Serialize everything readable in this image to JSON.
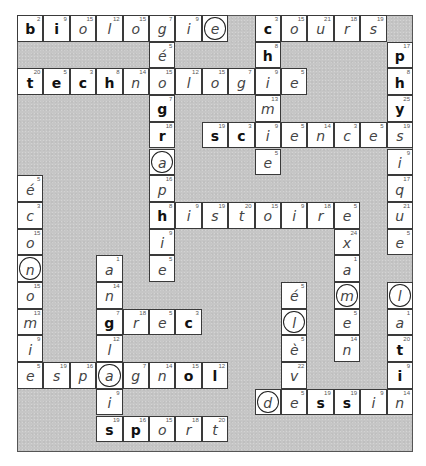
{
  "puzzle": {
    "type": "crossword",
    "cols": 15,
    "rows": 16,
    "colors": {
      "block": "#c6c6c6",
      "cell": "#ffffff",
      "border": "#3a3a3a",
      "text": "#222222"
    },
    "words": [
      "biologie",
      "cours",
      "technologie",
      "chimie",
      "géographie",
      "physique",
      "sciences",
      "histoire",
      "économie",
      "examen",
      "anglais",
      "grec",
      "élève",
      "latin",
      "espagnol",
      "dessin",
      "sport"
    ],
    "cells": [
      {
        "r": 0,
        "c": 0,
        "ch": "b",
        "n": "2",
        "style": "bold"
      },
      {
        "r": 0,
        "c": 1,
        "ch": "i",
        "n": "9",
        "style": "bold"
      },
      {
        "r": 0,
        "c": 2,
        "ch": "o",
        "n": "15",
        "style": "italic"
      },
      {
        "r": 0,
        "c": 3,
        "ch": "l",
        "n": "12",
        "style": "italic"
      },
      {
        "r": 0,
        "c": 4,
        "ch": "o",
        "n": "15",
        "style": "italic"
      },
      {
        "r": 0,
        "c": 5,
        "ch": "g",
        "n": "7",
        "style": "italic"
      },
      {
        "r": 0,
        "c": 6,
        "ch": "i",
        "n": "9",
        "style": "italic"
      },
      {
        "r": 0,
        "c": 7,
        "ch": "e",
        "n": "",
        "style": "italic",
        "circled": true
      },
      {
        "r": 0,
        "c": 9,
        "ch": "c",
        "n": "3",
        "style": "bold"
      },
      {
        "r": 0,
        "c": 10,
        "ch": "o",
        "n": "15",
        "style": "italic"
      },
      {
        "r": 0,
        "c": 11,
        "ch": "u",
        "n": "21",
        "style": "italic"
      },
      {
        "r": 0,
        "c": 12,
        "ch": "r",
        "n": "18",
        "style": "italic"
      },
      {
        "r": 0,
        "c": 13,
        "ch": "s",
        "n": "19",
        "style": "italic"
      },
      {
        "r": 1,
        "c": 5,
        "ch": "é",
        "n": "5",
        "style": "italic"
      },
      {
        "r": 1,
        "c": 9,
        "ch": "h",
        "n": "8",
        "style": "bold"
      },
      {
        "r": 1,
        "c": 14,
        "ch": "p",
        "n": "17",
        "style": "bold"
      },
      {
        "r": 2,
        "c": 0,
        "ch": "t",
        "n": "20",
        "style": "bold"
      },
      {
        "r": 2,
        "c": 1,
        "ch": "e",
        "n": "5",
        "style": "bold"
      },
      {
        "r": 2,
        "c": 2,
        "ch": "c",
        "n": "3",
        "style": "bold"
      },
      {
        "r": 2,
        "c": 3,
        "ch": "h",
        "n": "8",
        "style": "bold"
      },
      {
        "r": 2,
        "c": 4,
        "ch": "n",
        "n": "14",
        "style": "italic"
      },
      {
        "r": 2,
        "c": 5,
        "ch": "o",
        "n": "15",
        "style": "italic"
      },
      {
        "r": 2,
        "c": 6,
        "ch": "l",
        "n": "12",
        "style": "italic"
      },
      {
        "r": 2,
        "c": 7,
        "ch": "o",
        "n": "15",
        "style": "italic"
      },
      {
        "r": 2,
        "c": 8,
        "ch": "g",
        "n": "7",
        "style": "italic"
      },
      {
        "r": 2,
        "c": 9,
        "ch": "i",
        "n": "9",
        "style": "italic"
      },
      {
        "r": 2,
        "c": 10,
        "ch": "e",
        "n": "5",
        "style": "italic"
      },
      {
        "r": 2,
        "c": 14,
        "ch": "h",
        "n": "8",
        "style": "bold"
      },
      {
        "r": 3,
        "c": 5,
        "ch": "g",
        "n": "7",
        "style": "bold"
      },
      {
        "r": 3,
        "c": 9,
        "ch": "m",
        "n": "13",
        "style": "italic"
      },
      {
        "r": 3,
        "c": 14,
        "ch": "y",
        "n": "25",
        "style": "bold"
      },
      {
        "r": 4,
        "c": 5,
        "ch": "r",
        "n": "18",
        "style": "bold"
      },
      {
        "r": 4,
        "c": 7,
        "ch": "s",
        "n": "19",
        "style": "bold"
      },
      {
        "r": 4,
        "c": 8,
        "ch": "c",
        "n": "3",
        "style": "bold"
      },
      {
        "r": 4,
        "c": 9,
        "ch": "i",
        "n": "9",
        "style": "italic"
      },
      {
        "r": 4,
        "c": 10,
        "ch": "e",
        "n": "5",
        "style": "italic"
      },
      {
        "r": 4,
        "c": 11,
        "ch": "n",
        "n": "14",
        "style": "italic"
      },
      {
        "r": 4,
        "c": 12,
        "ch": "c",
        "n": "3",
        "style": "italic"
      },
      {
        "r": 4,
        "c": 13,
        "ch": "e",
        "n": "5",
        "style": "italic"
      },
      {
        "r": 4,
        "c": 14,
        "ch": "s",
        "n": "19",
        "style": "italic"
      },
      {
        "r": 5,
        "c": 5,
        "ch": "a",
        "n": "",
        "style": "italic",
        "circled": true
      },
      {
        "r": 5,
        "c": 9,
        "ch": "e",
        "n": "5",
        "style": "italic"
      },
      {
        "r": 5,
        "c": 14,
        "ch": "i",
        "n": "9",
        "style": "italic"
      },
      {
        "r": 6,
        "c": 0,
        "ch": "é",
        "n": "5",
        "style": "italic"
      },
      {
        "r": 6,
        "c": 5,
        "ch": "p",
        "n": "16",
        "style": "italic"
      },
      {
        "r": 6,
        "c": 14,
        "ch": "q",
        "n": "17",
        "style": "italic"
      },
      {
        "r": 7,
        "c": 0,
        "ch": "c",
        "n": "3",
        "style": "italic"
      },
      {
        "r": 7,
        "c": 5,
        "ch": "h",
        "n": "8",
        "style": "bold"
      },
      {
        "r": 7,
        "c": 6,
        "ch": "i",
        "n": "9",
        "style": "italic"
      },
      {
        "r": 7,
        "c": 7,
        "ch": "s",
        "n": "19",
        "style": "italic"
      },
      {
        "r": 7,
        "c": 8,
        "ch": "t",
        "n": "20",
        "style": "italic"
      },
      {
        "r": 7,
        "c": 9,
        "ch": "o",
        "n": "15",
        "style": "italic"
      },
      {
        "r": 7,
        "c": 10,
        "ch": "i",
        "n": "9",
        "style": "italic"
      },
      {
        "r": 7,
        "c": 11,
        "ch": "r",
        "n": "18",
        "style": "italic"
      },
      {
        "r": 7,
        "c": 12,
        "ch": "e",
        "n": "5",
        "style": "italic"
      },
      {
        "r": 7,
        "c": 14,
        "ch": "u",
        "n": "21",
        "style": "italic"
      },
      {
        "r": 8,
        "c": 0,
        "ch": "o",
        "n": "15",
        "style": "italic"
      },
      {
        "r": 8,
        "c": 5,
        "ch": "i",
        "n": "9",
        "style": "italic"
      },
      {
        "r": 8,
        "c": 12,
        "ch": "x",
        "n": "24",
        "style": "italic"
      },
      {
        "r": 8,
        "c": 14,
        "ch": "e",
        "n": "5",
        "style": "italic"
      },
      {
        "r": 9,
        "c": 0,
        "ch": "n",
        "n": "",
        "style": "italic",
        "circled": true
      },
      {
        "r": 9,
        "c": 3,
        "ch": "a",
        "n": "1",
        "style": "italic"
      },
      {
        "r": 9,
        "c": 5,
        "ch": "e",
        "n": "5",
        "style": "italic"
      },
      {
        "r": 9,
        "c": 12,
        "ch": "a",
        "n": "1",
        "style": "italic"
      },
      {
        "r": 10,
        "c": 0,
        "ch": "o",
        "n": "15",
        "style": "italic"
      },
      {
        "r": 10,
        "c": 3,
        "ch": "n",
        "n": "14",
        "style": "italic"
      },
      {
        "r": 10,
        "c": 10,
        "ch": "é",
        "n": "5",
        "style": "italic"
      },
      {
        "r": 10,
        "c": 12,
        "ch": "m",
        "n": "",
        "style": "italic",
        "circled": true
      },
      {
        "r": 10,
        "c": 14,
        "ch": "l",
        "n": "",
        "style": "italic",
        "circled": true
      },
      {
        "r": 11,
        "c": 0,
        "ch": "m",
        "n": "13",
        "style": "italic"
      },
      {
        "r": 11,
        "c": 3,
        "ch": "g",
        "n": "7",
        "style": "bold"
      },
      {
        "r": 11,
        "c": 4,
        "ch": "r",
        "n": "18",
        "style": "italic"
      },
      {
        "r": 11,
        "c": 5,
        "ch": "e",
        "n": "5",
        "style": "italic"
      },
      {
        "r": 11,
        "c": 6,
        "ch": "c",
        "n": "3",
        "style": "bold"
      },
      {
        "r": 11,
        "c": 10,
        "ch": "l",
        "n": "",
        "style": "italic",
        "circled": true
      },
      {
        "r": 11,
        "c": 12,
        "ch": "e",
        "n": "5",
        "style": "italic"
      },
      {
        "r": 11,
        "c": 14,
        "ch": "a",
        "n": "1",
        "style": "italic"
      },
      {
        "r": 12,
        "c": 0,
        "ch": "i",
        "n": "9",
        "style": "italic"
      },
      {
        "r": 12,
        "c": 3,
        "ch": "l",
        "n": "12",
        "style": "italic"
      },
      {
        "r": 12,
        "c": 10,
        "ch": "è",
        "n": "5",
        "style": "italic"
      },
      {
        "r": 12,
        "c": 12,
        "ch": "n",
        "n": "14",
        "style": "italic"
      },
      {
        "r": 12,
        "c": 14,
        "ch": "t",
        "n": "20",
        "style": "bold"
      },
      {
        "r": 13,
        "c": 0,
        "ch": "e",
        "n": "5",
        "style": "italic"
      },
      {
        "r": 13,
        "c": 1,
        "ch": "s",
        "n": "19",
        "style": "italic"
      },
      {
        "r": 13,
        "c": 2,
        "ch": "p",
        "n": "16",
        "style": "italic"
      },
      {
        "r": 13,
        "c": 3,
        "ch": "a",
        "n": "",
        "style": "italic",
        "circled": true
      },
      {
        "r": 13,
        "c": 4,
        "ch": "g",
        "n": "7",
        "style": "italic"
      },
      {
        "r": 13,
        "c": 5,
        "ch": "n",
        "n": "14",
        "style": "italic"
      },
      {
        "r": 13,
        "c": 6,
        "ch": "o",
        "n": "15",
        "style": "bold"
      },
      {
        "r": 13,
        "c": 7,
        "ch": "l",
        "n": "12",
        "style": "bold"
      },
      {
        "r": 13,
        "c": 10,
        "ch": "v",
        "n": "22",
        "style": "italic"
      },
      {
        "r": 13,
        "c": 14,
        "ch": "i",
        "n": "9",
        "style": "bold"
      },
      {
        "r": 14,
        "c": 3,
        "ch": "i",
        "n": "9",
        "style": "italic"
      },
      {
        "r": 14,
        "c": 9,
        "ch": "d",
        "n": "",
        "style": "italic",
        "circled": true
      },
      {
        "r": 14,
        "c": 10,
        "ch": "e",
        "n": "5",
        "style": "italic"
      },
      {
        "r": 14,
        "c": 11,
        "ch": "s",
        "n": "19",
        "style": "bold"
      },
      {
        "r": 14,
        "c": 12,
        "ch": "s",
        "n": "19",
        "style": "bold"
      },
      {
        "r": 14,
        "c": 13,
        "ch": "i",
        "n": "9",
        "style": "italic"
      },
      {
        "r": 14,
        "c": 14,
        "ch": "n",
        "n": "14",
        "style": "italic"
      },
      {
        "r": 15,
        "c": 3,
        "ch": "s",
        "n": "19",
        "style": "bold"
      },
      {
        "r": 15,
        "c": 4,
        "ch": "p",
        "n": "16",
        "style": "bold"
      },
      {
        "r": 15,
        "c": 5,
        "ch": "o",
        "n": "15",
        "style": "italic"
      },
      {
        "r": 15,
        "c": 6,
        "ch": "r",
        "n": "18",
        "style": "italic"
      },
      {
        "r": 15,
        "c": 7,
        "ch": "t",
        "n": "20",
        "style": "italic"
      }
    ]
  }
}
